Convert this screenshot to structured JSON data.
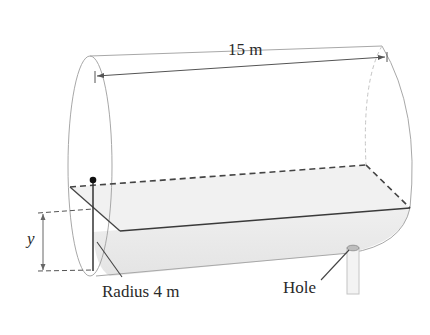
{
  "diagram": {
    "labels": {
      "length": "15 m",
      "depth_variable": "y",
      "radius": "Radius 4 m",
      "hole": "Hole"
    },
    "colors": {
      "outline": "#9a9a9a",
      "liquid_fill": "#ececec",
      "edge_dark": "#3a3a3a",
      "text": "#2a2a2a"
    }
  }
}
